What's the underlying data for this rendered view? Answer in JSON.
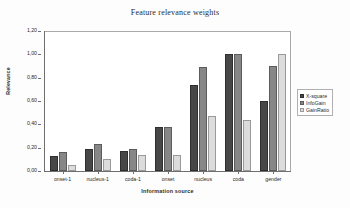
{
  "chart_data": {
    "type": "bar",
    "title": "Feature relevance weights",
    "xlabel": "Information source",
    "ylabel": "Relevance",
    "categories": [
      "onset-1",
      "nucleus-1",
      "coda-1",
      "onset",
      "nucleus",
      "coda",
      "gender"
    ],
    "series": [
      {
        "name": "X-square",
        "color": "#474747",
        "values": [
          0.13,
          0.19,
          0.17,
          0.38,
          0.74,
          1.0,
          0.6
        ]
      },
      {
        "name": "InfoGain",
        "color": "#878787",
        "values": [
          0.16,
          0.23,
          0.19,
          0.38,
          0.89,
          1.0,
          0.9
        ]
      },
      {
        "name": "GainRatio",
        "color": "#dcdcdc",
        "values": [
          0.055,
          0.1,
          0.135,
          0.14,
          0.47,
          0.44,
          1.0
        ]
      }
    ],
    "ylim": [
      0.0,
      1.2
    ],
    "ytick_labels": [
      "0,00",
      "0,20",
      "0,40",
      "0,60",
      "0,80",
      "1,00",
      "1,20"
    ],
    "ytick_values": [
      0.0,
      0.2,
      0.4,
      0.6,
      0.8,
      1.0,
      1.2
    ],
    "grid": false,
    "legend_position": "right"
  }
}
